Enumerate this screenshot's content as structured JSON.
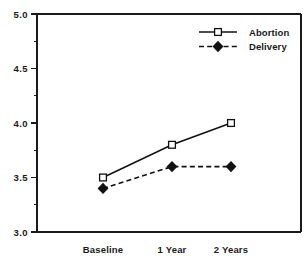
{
  "chart_data": {
    "type": "line",
    "title": "",
    "subtitle": "",
    "xlabel": "",
    "ylabel": "",
    "categories": [
      "Baseline",
      "1 Year",
      "2 Years"
    ],
    "series": [
      {
        "name": "Abortion",
        "values": [
          3.5,
          3.8,
          4.0
        ],
        "style": "solid",
        "marker": "open-square"
      },
      {
        "name": "Delivery",
        "values": [
          3.4,
          3.6,
          3.6
        ],
        "style": "dashed",
        "marker": "filled-diamond"
      }
    ],
    "ylim": [
      3.0,
      5.0
    ],
    "ytick_labels": [
      "3.0",
      "3.5",
      "4.0",
      "4.5",
      "5.0"
    ],
    "ytick_values": [
      3.0,
      3.5,
      4.0,
      4.5,
      5.0
    ],
    "yminor_values": [
      3.25,
      3.75,
      4.25,
      4.75
    ],
    "grid": false,
    "legend_position": "top-right",
    "line_color": "#111111",
    "axis_color": "#1a1a1a",
    "background": "#ffffff"
  },
  "axis": {
    "y_labels": [
      "5.0",
      "4.5",
      "4.0",
      "3.5",
      "3.0"
    ]
  },
  "categories": {
    "c0": "Baseline",
    "c1": "1 Year",
    "c2": "2 Years"
  },
  "legend": {
    "entries": [
      {
        "label": "Abortion"
      },
      {
        "label": "Delivery"
      }
    ],
    "e0": "Abortion",
    "e1": "Delivery"
  }
}
